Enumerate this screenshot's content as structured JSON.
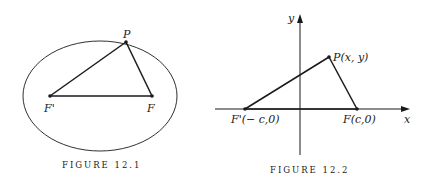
{
  "figure1": {
    "caption": "FIGURE 12.1",
    "labels": {
      "p": "P",
      "f_prime": "F'",
      "f": "F"
    },
    "ellipse": {
      "cx": 100,
      "cy": 96,
      "rx": 77,
      "ry": 55
    },
    "points": {
      "p": [
        126,
        42
      ],
      "f_prime": [
        50,
        96
      ],
      "f": [
        152,
        96
      ]
    }
  },
  "figure2": {
    "caption": "FIGURE 12.2",
    "axes": {
      "x_label": "x",
      "y_label": "y"
    },
    "labels": {
      "p": "P(x, y)",
      "f_prime": "F'(− c,0)",
      "f": "F(c,0)"
    },
    "points": {
      "p": [
        329,
        57
      ],
      "f_prime": [
        245,
        109
      ],
      "f": [
        357,
        109
      ]
    }
  },
  "colors": {
    "ink": "#1a1a1a",
    "background": "#ffffff"
  }
}
